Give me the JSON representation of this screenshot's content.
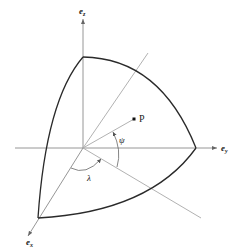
{
  "diagram": {
    "axes": {
      "ez": {
        "label_base": "e",
        "label_sub": "z"
      },
      "ey": {
        "label_base": "e",
        "label_sub": "y"
      },
      "ex": {
        "label_base": "e",
        "label_sub": "x"
      }
    },
    "point": {
      "label": "P"
    },
    "angles": {
      "psi": {
        "label": "ψ"
      },
      "lambda": {
        "label": "λ"
      }
    },
    "colors": {
      "edge": "#2a2a2a",
      "axis": "#8a8a8a",
      "guide": "#a8a8a8",
      "background": "#ffffff"
    }
  }
}
